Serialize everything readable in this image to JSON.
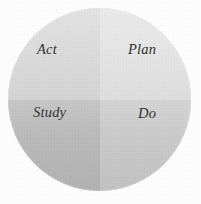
{
  "diagram": {
    "type": "pdsa-cycle",
    "shape": "circle-four-quadrants",
    "background_color": "#ffffff",
    "quadrants": [
      {
        "key": "act",
        "label": "Act",
        "position": "top-left",
        "fill_color": "#dcdcdc"
      },
      {
        "key": "plan",
        "label": "Plan",
        "position": "top-right",
        "fill_color": "#e6e6e6"
      },
      {
        "key": "study",
        "label": "Study",
        "position": "bottom-left",
        "fill_color": "#b8b8b8"
      },
      {
        "key": "do",
        "label": "Do",
        "position": "bottom-right",
        "fill_color": "#c9c9c9"
      }
    ],
    "label_color": "#2c2c2c"
  }
}
